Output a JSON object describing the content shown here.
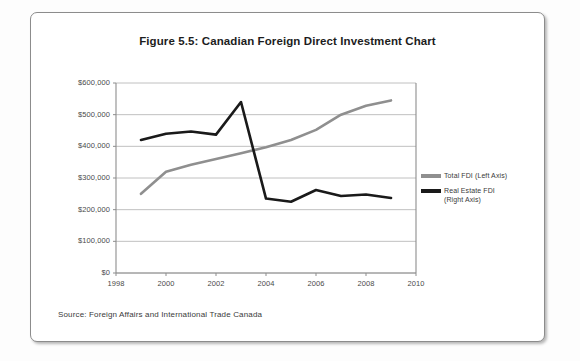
{
  "figure": {
    "title": "Figure 5.5: Canadian Foreign Direct Investment Chart",
    "source": "Source: Foreign Affairs and International Trade Canada"
  },
  "legend": {
    "items": [
      {
        "label": "Total FDI (Left Axis)",
        "color": "#8f8f8f",
        "swatch_name": "legend-swatch-total-fdi"
      },
      {
        "label": "Real Estate FDI\n(Right Axis)",
        "color": "#1a1a1a",
        "swatch_name": "legend-swatch-real-estate-fdi"
      }
    ]
  },
  "chart_data": {
    "type": "line",
    "title": "Figure 5.5: Canadian Foreign Direct Investment Chart",
    "xlabel": "",
    "ylabel": "",
    "xlim": [
      1998,
      2010
    ],
    "ylim": [
      0,
      600000
    ],
    "xticks": [
      "1998",
      "2000",
      "2002",
      "2004",
      "2006",
      "2008",
      "2010"
    ],
    "xtick_values": [
      1998,
      2000,
      2002,
      2004,
      2006,
      2008,
      2010
    ],
    "yticks": [
      "$0",
      "$100,000",
      "$200,000",
      "$300,000",
      "$400,000",
      "$500,000",
      "$600,000"
    ],
    "ytick_values": [
      0,
      100000,
      200000,
      300000,
      400000,
      500000,
      600000
    ],
    "grid": true,
    "legend_position": "right",
    "x": [
      1999,
      2000,
      2001,
      2002,
      2003,
      2004,
      2005,
      2006,
      2007,
      2008,
      2009
    ],
    "series": [
      {
        "name": "Total FDI (Left Axis)",
        "color": "#8f8f8f",
        "values": [
          250000,
          320000,
          342000,
          360000,
          378000,
          397000,
          420000,
          452000,
          500000,
          528000,
          545000
        ]
      },
      {
        "name": "Real Estate FDI (Right Axis)",
        "color": "#1a1a1a",
        "values": [
          420000,
          440000,
          447000,
          437000,
          540000,
          235000,
          225000,
          262000,
          243000,
          248000,
          237000
        ]
      }
    ]
  }
}
